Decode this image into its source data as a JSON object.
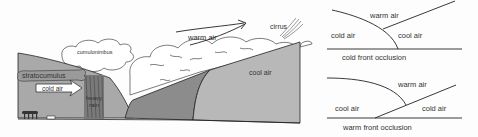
{
  "main_diagram": {
    "labels": {
      "cumulonimbus": "cumulonimbus",
      "stratocumulus": "stratocumulus",
      "cold_air": "cold air",
      "heavy_rain_1": "heavy",
      "heavy_rain_2": "rain",
      "warm_air": "warm air",
      "cirrus": "cirrus",
      "cool_air": "cool air"
    },
    "colors": {
      "cold_air_mass": "#a9a9a9",
      "occluded_wedge": "#8c8c8c",
      "cool_air_mass": "#b8b8b8",
      "cloud_fill": "#ffffff",
      "line": "#222222"
    }
  },
  "cold_front_occlusion": {
    "title": "cold front occlusion",
    "labels": {
      "warm_air": "warm air",
      "cold_air": "cold air",
      "cool_air": "cool air"
    }
  },
  "warm_front_occlusion": {
    "title": "warm front occlusion",
    "labels": {
      "warm_air": "warm air",
      "cool_air": "cool air",
      "cold_air": "cold air"
    }
  }
}
